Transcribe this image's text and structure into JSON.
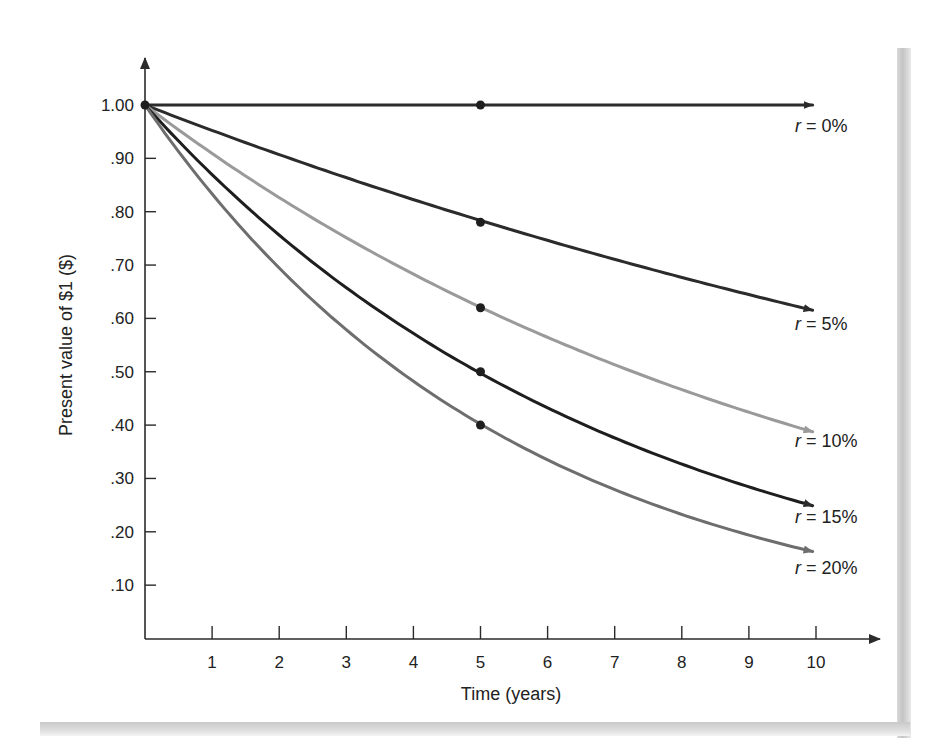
{
  "chart_data": {
    "type": "line",
    "title": "",
    "xlabel": "Time (years)",
    "ylabel": "Present value of $1 ($)",
    "xlim": [
      0,
      10.5
    ],
    "ylim": [
      0,
      1.1
    ],
    "grid": false,
    "x_ticks": [
      "1",
      "2",
      "3",
      "4",
      "5",
      "6",
      "7",
      "8",
      "9",
      "10"
    ],
    "y_ticks": [
      "1.00",
      ".90",
      ".80",
      ".70",
      ".60",
      ".50",
      ".40",
      ".30",
      ".20",
      ".10"
    ],
    "x": [
      0,
      1,
      2,
      3,
      4,
      5,
      6,
      7,
      8,
      9,
      10
    ],
    "series": [
      {
        "name": "r = 0%",
        "label_prefix": "r",
        "label_rest": " = 0%",
        "rate": 0.0,
        "color": "#2b2b2b",
        "values": [
          1.0,
          1.0,
          1.0,
          1.0,
          1.0,
          1.0,
          1.0,
          1.0,
          1.0,
          1.0,
          1.0
        ]
      },
      {
        "name": "r = 5%",
        "label_prefix": "r",
        "label_rest": " = 5%",
        "rate": 0.05,
        "color": "#2b2b2b",
        "values": [
          1.0,
          0.95,
          0.91,
          0.86,
          0.82,
          0.78,
          0.75,
          0.71,
          0.68,
          0.64,
          0.61
        ]
      },
      {
        "name": "r = 10%",
        "label_prefix": "r",
        "label_rest": " = 10%",
        "rate": 0.1,
        "color": "#9a9a9a",
        "values": [
          1.0,
          0.91,
          0.83,
          0.75,
          0.68,
          0.62,
          0.56,
          0.51,
          0.47,
          0.42,
          0.39
        ]
      },
      {
        "name": "r = 15%",
        "label_prefix": "r",
        "label_rest": " = 15%",
        "rate": 0.15,
        "color": "#1e1e1e",
        "values": [
          1.0,
          0.87,
          0.76,
          0.66,
          0.57,
          0.5,
          0.43,
          0.38,
          0.33,
          0.28,
          0.25
        ]
      },
      {
        "name": "r = 20%",
        "label_prefix": "r",
        "label_rest": " = 20%",
        "rate": 0.2,
        "color": "#6e6e6e",
        "values": [
          1.0,
          0.83,
          0.69,
          0.58,
          0.48,
          0.4,
          0.33,
          0.28,
          0.23,
          0.19,
          0.16
        ]
      }
    ],
    "markers": [
      {
        "x": 0,
        "y": 1.0
      },
      {
        "x": 5,
        "y": 1.0
      },
      {
        "x": 5,
        "y": 0.78
      },
      {
        "x": 5,
        "y": 0.62
      },
      {
        "x": 5,
        "y": 0.5
      },
      {
        "x": 5,
        "y": 0.4
      }
    ],
    "legend_position": "inline at right end of each curve"
  }
}
